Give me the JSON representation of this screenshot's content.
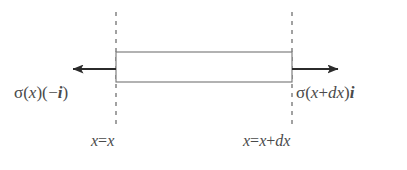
{
  "figure": {
    "background_color": "#ffffff",
    "line_color": "#6b6b6b",
    "arrow_color": "#2b2b2b",
    "text_color": "#4a4a4a",
    "dash_color": "#7a7a7a"
  },
  "element": {
    "name": "differential-element",
    "fill_color": "#ffffff",
    "stroke_color": "#7a7a7a",
    "left_x": 116,
    "right_x": 292,
    "top_y": 52,
    "bottom_y": 82
  },
  "boundaries": [
    {
      "name": "left-boundary",
      "x": 116,
      "top_y": 12,
      "bottom_y": 128,
      "style": "dashed",
      "position_label": "x = x"
    },
    {
      "name": "right-boundary",
      "x": 292,
      "top_y": 12,
      "bottom_y": 128,
      "style": "dashed",
      "position_label": "x = x + dx"
    }
  ],
  "arrows": [
    {
      "name": "left-traction-arrow",
      "direction": "left",
      "tail_x": 116,
      "head_x": 62,
      "y": 69
    },
    {
      "name": "right-traction-arrow",
      "direction": "right",
      "tail_x": 292,
      "head_x": 349,
      "y": 69
    }
  ],
  "labels": {
    "left_traction": {
      "sigma": "σ",
      "open_paren": "(",
      "argument": "x",
      "close_paren": ")",
      "factor_open": "(",
      "minus": "−",
      "unit_vector": "i",
      "factor_close": ")",
      "full_text": "σ(x)(−i)"
    },
    "right_traction": {
      "sigma": "σ",
      "open_paren": "(",
      "argument_x": "x",
      "plus": "+",
      "argument_dx": "dx",
      "close_paren": ")",
      "unit_vector": "i",
      "full_text": "σ(x+dx)i"
    },
    "left_position": {
      "lhs": "x",
      "equals": "=",
      "rhs": "x",
      "full_text": "x = x"
    },
    "right_position": {
      "lhs": "x",
      "equals": "=",
      "rhs_x": "x",
      "plus": "+",
      "rhs_dx": "dx",
      "full_text": "x = x + dx"
    }
  }
}
